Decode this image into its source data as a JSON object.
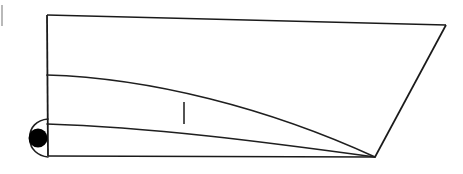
{
  "figure": {
    "kind": "line-art-diagram",
    "background_color": "#ffffff",
    "line_color": "#1a1a1a",
    "marker_color": "#000000",
    "smudge_color": "#b9b9b9",
    "canvas": {
      "width": 463,
      "height": 174
    }
  },
  "geometry": {
    "deck_line": {
      "name": "deck-line",
      "from": [
        47,
        15
      ],
      "to": [
        446,
        25
      ],
      "stroke_width": 1.6
    },
    "stem_line": {
      "name": "stem-line",
      "from": [
        47,
        15
      ],
      "to": [
        48,
        156
      ],
      "stroke_width": 1.8
    },
    "transom_line": {
      "name": "transom-line",
      "from": [
        446,
        25
      ],
      "to": [
        375,
        157
      ],
      "stroke_width": 1.7
    },
    "base_line": {
      "name": "base-line",
      "from": [
        48,
        156
      ],
      "to": [
        375,
        157
      ],
      "stroke_width": 1.6
    },
    "sheer_curve": {
      "name": "sheer-curve",
      "start": [
        47,
        75
      ],
      "control_1": [
        150,
        78
      ],
      "control_2": [
        268,
        108
      ],
      "end": [
        375,
        157
      ],
      "stroke_width": 1.7
    },
    "waterline_curve": {
      "name": "waterline-curve",
      "start": [
        47,
        124
      ],
      "control_1": [
        150,
        127
      ],
      "control_2": [
        265,
        142
      ],
      "end": [
        375,
        157
      ],
      "stroke_width": 1.6
    },
    "bow_hook_upper": {
      "name": "bow-hook-upper",
      "start": [
        48,
        119
      ],
      "control_1": [
        36,
        120
      ],
      "control_2": [
        30,
        128
      ],
      "end": [
        30,
        136
      ],
      "stroke_width": 1.6
    },
    "bow_hook_lower": {
      "name": "bow-hook-lower",
      "start": [
        30,
        140
      ],
      "control_1": [
        30,
        149
      ],
      "control_2": [
        38,
        156
      ],
      "end": [
        48,
        157
      ],
      "stroke_width": 1.6
    },
    "station_tick": {
      "name": "station-tick",
      "from": [
        184,
        102
      ],
      "to": [
        184,
        124
      ],
      "stroke_width": 1.5
    },
    "pivot_marker": {
      "name": "pivot-marker",
      "center": [
        38,
        138
      ],
      "radius": 9.5
    },
    "left_edge_smudge": {
      "name": "left-edge-smudge",
      "from": [
        2,
        5
      ],
      "to": [
        2,
        26
      ],
      "stroke_width": 2.0
    }
  },
  "labels": {
    "none_visible": ""
  }
}
